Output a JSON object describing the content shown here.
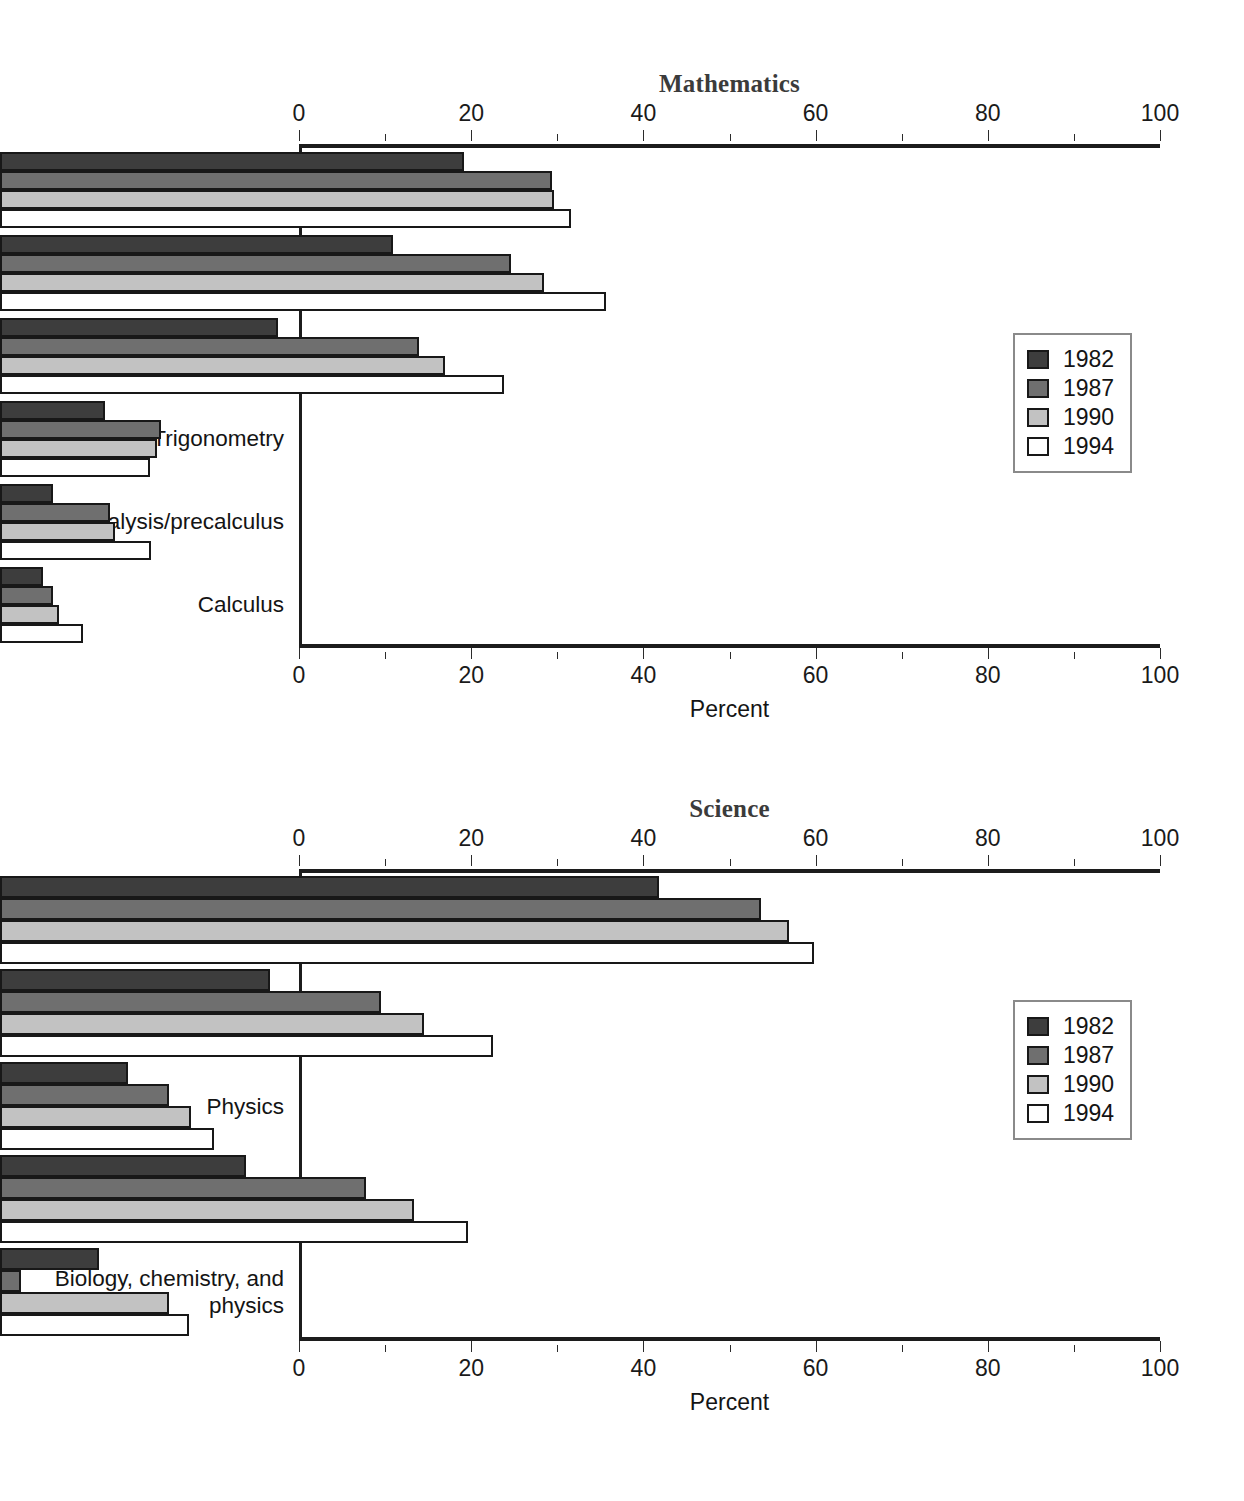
{
  "page": {
    "background": "#ffffff",
    "series_colors": {
      "1982": "#3d3d3d",
      "1987": "#6f6f6f",
      "1990": "#c2c2c2",
      "1994": "#ffffff"
    },
    "axis_title": "Percent",
    "tick_labels": [
      "0",
      "20",
      "40",
      "60",
      "80",
      "100"
    ],
    "legend_labels": [
      "1982",
      "1987",
      "1990",
      "1994"
    ]
  },
  "charts": [
    {
      "id": "mathematics",
      "title": "Mathematics",
      "axis_title": "Percent",
      "top_tick_labels": [
        "0",
        "20",
        "40",
        "60",
        "80",
        "100"
      ],
      "bottom_tick_labels": [
        "0",
        "20",
        "40",
        "60",
        "80",
        "100"
      ],
      "categories": [
        "Algebra I",
        "Geometry",
        "Algebra II",
        "Trigonometry",
        "Analysis/precalculus",
        "Calculus"
      ],
      "legend": [
        "1982",
        "1987",
        "1990",
        "1994"
      ]
    },
    {
      "id": "science",
      "title": "Science",
      "axis_title": "Percent",
      "top_tick_labels": [
        "0",
        "20",
        "40",
        "60",
        "80",
        "100"
      ],
      "bottom_tick_labels": [
        "0",
        "20",
        "40",
        "60",
        "80",
        "100"
      ],
      "categories": [
        "Biology",
        "Chemistry",
        "Physics",
        "Biology and chemistry",
        "Biology, chemistry, and\nphysics"
      ],
      "legend": [
        "1982",
        "1987",
        "1990",
        "1994"
      ]
    }
  ],
  "chart_data": [
    {
      "type": "bar",
      "orientation": "horizontal",
      "title": "Mathematics",
      "xlabel": "Percent",
      "ylabel": "",
      "xlim": [
        0,
        100
      ],
      "xticks": [
        0,
        20,
        40,
        60,
        80,
        100
      ],
      "grid": false,
      "legend_position": "right-middle",
      "categories": [
        "Algebra I",
        "Geometry",
        "Algebra II",
        "Trigonometry",
        "Analysis/precalculus",
        "Calculus"
      ],
      "series": [
        {
          "name": "1982",
          "values": [
            53.9,
            45.6,
            32.3,
            12.2,
            6.2,
            5.0
          ]
        },
        {
          "name": "1987",
          "values": [
            64.1,
            59.3,
            48.7,
            18.7,
            12.8,
            6.2
          ]
        },
        {
          "name": "1990",
          "values": [
            64.3,
            63.2,
            51.7,
            18.2,
            13.4,
            6.9
          ]
        },
        {
          "name": "1994",
          "values": [
            66.3,
            70.4,
            58.5,
            17.4,
            17.5,
            9.6
          ]
        }
      ]
    },
    {
      "type": "bar",
      "orientation": "horizontal",
      "title": "Science",
      "xlabel": "Percent",
      "ylabel": "",
      "xlim": [
        0,
        100
      ],
      "xticks": [
        0,
        20,
        40,
        60,
        80,
        100
      ],
      "grid": false,
      "legend_position": "right-middle",
      "categories": [
        "Biology",
        "Chemistry",
        "Physics",
        "Biology and chemistry",
        "Biology, chemistry, and physics"
      ],
      "series": [
        {
          "name": "1982",
          "values": [
            76.5,
            31.4,
            14.9,
            28.6,
            11.5
          ]
        },
        {
          "name": "1987",
          "values": [
            88.4,
            44.2,
            19.6,
            42.5,
            2.4
          ]
        },
        {
          "name": "1990",
          "values": [
            91.6,
            49.2,
            22.2,
            48.1,
            19.6
          ]
        },
        {
          "name": "1994",
          "values": [
            94.5,
            57.3,
            24.9,
            54.4,
            21.9
          ]
        }
      ]
    }
  ]
}
